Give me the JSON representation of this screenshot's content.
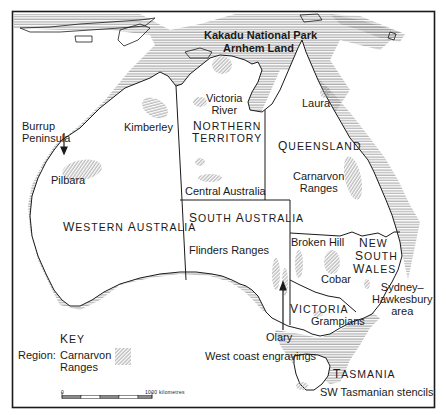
{
  "colors": {
    "ink": "#1a1a1a",
    "coast_hatch": "#8a8a8a",
    "region_hatch": "#9a9a9a",
    "background": "#ffffff"
  },
  "states": [
    {
      "id": "wa",
      "label": "Western Australia"
    },
    {
      "id": "nt",
      "label": "Northern Territory"
    },
    {
      "id": "qld",
      "label": "Queensland"
    },
    {
      "id": "sa",
      "label": "South Australia"
    },
    {
      "id": "nsw",
      "label": "New South Wales"
    },
    {
      "id": "vic",
      "label": "Victoria"
    },
    {
      "id": "tas",
      "label": "Tasmania"
    }
  ],
  "state_labels": {
    "wa": {
      "first": "W",
      "rest1": "ESTERN ",
      "first2": "A",
      "rest2": "USTRALIA"
    },
    "nt": {
      "line1_first": "N",
      "line1_rest": "ORTHERN",
      "line2_first": "T",
      "line2_rest": "ERRITORY"
    },
    "qld": {
      "first": "Q",
      "rest": "UEENSLAND"
    },
    "sa": {
      "first": "S",
      "rest1": "OUTH ",
      "first2": "A",
      "rest2": "USTRALIA"
    },
    "nsw": {
      "line1_first": "N",
      "line1_rest": "EW",
      "line2_first": "S",
      "line2_rest": "OUTH",
      "line3_first": "W",
      "line3_rest": "ALES"
    },
    "vic": {
      "first": "V",
      "rest": "ICTORIA"
    },
    "tas": {
      "first": "T",
      "rest": "ASMANIA"
    }
  },
  "sites": [
    {
      "id": "kakadu",
      "label": "Kakadu National Park"
    },
    {
      "id": "arnhem",
      "label": "Arnhem Land"
    },
    {
      "id": "victoria-river",
      "line1": "Victoria",
      "line2": "River"
    },
    {
      "id": "laura",
      "label": "Laura"
    },
    {
      "id": "kimberley",
      "label": "Kimberley"
    },
    {
      "id": "burrup",
      "line1": "Burrup",
      "line2": "Peninsula"
    },
    {
      "id": "pilbara",
      "label": "Pilbara"
    },
    {
      "id": "central-australia",
      "label": "Central Australia"
    },
    {
      "id": "carnarvon",
      "line1": "Carnarvon",
      "line2": "Ranges"
    },
    {
      "id": "flinders",
      "label": "Flinders Ranges"
    },
    {
      "id": "broken-hill",
      "label": "Broken Hill"
    },
    {
      "id": "cobar",
      "label": "Cobar"
    },
    {
      "id": "sydney",
      "line1": "Sydney–",
      "line2": "Hawkesbury",
      "line3": "area"
    },
    {
      "id": "grampians",
      "label": "Grampians"
    },
    {
      "id": "olary",
      "label": "Olary"
    },
    {
      "id": "west-coast",
      "label": "West coast engravings"
    },
    {
      "id": "sw-tas",
      "label": "SW Tasmanian stencils"
    }
  ],
  "key": {
    "title_first": "K",
    "title_rest": "EY",
    "region_label": "Region:",
    "example_line1": "Carnarvon",
    "example_line2": "Ranges"
  },
  "scale": {
    "start": "0",
    "end": "1000 kilometres",
    "segments": 5
  }
}
